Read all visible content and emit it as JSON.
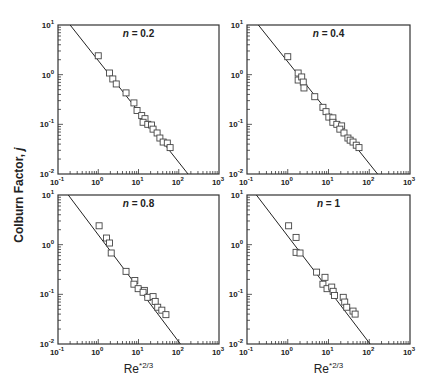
{
  "figure": {
    "ylabel_text": "Colburn Factor, ",
    "ylabel_var": "j",
    "xlabel_base": "Re",
    "xlabel_sup": "*2/3"
  },
  "chart_data": [
    {
      "type": "scatter",
      "panel": "top-left",
      "annotation_var": "n",
      "annotation_value": "= 0.2",
      "xlabel": "",
      "ylabel": "Colburn Factor, j",
      "xscale": "log",
      "yscale": "log",
      "xlim": [
        0.1,
        1000
      ],
      "ylim": [
        0.01,
        10
      ],
      "xticks": [
        "10^-1",
        "10^0",
        "10^1",
        "10^2",
        "10^3"
      ],
      "yticks": [
        "10^-2",
        "10^-1",
        "10^0",
        "10^1"
      ],
      "marker": "open-square",
      "points": [
        [
          1.0,
          2.4
        ],
        [
          1.9,
          1.08
        ],
        [
          2.3,
          0.82
        ],
        [
          2.8,
          0.65
        ],
        [
          4.9,
          0.43
        ],
        [
          7.7,
          0.27
        ],
        [
          9.2,
          0.19
        ],
        [
          12,
          0.15
        ],
        [
          14.5,
          0.13
        ],
        [
          13,
          0.11
        ],
        [
          17,
          0.1
        ],
        [
          21,
          0.097
        ],
        [
          23,
          0.08
        ],
        [
          29,
          0.067
        ],
        [
          34,
          0.053
        ],
        [
          41,
          0.044
        ],
        [
          52,
          0.042
        ],
        [
          61,
          0.034
        ]
      ],
      "fit_line": {
        "x": [
          0.2,
          170
        ],
        "y": [
          10,
          0.01
        ]
      }
    },
    {
      "type": "scatter",
      "panel": "top-right",
      "annotation_var": "n",
      "annotation_value": "= 0.4",
      "xlabel": "",
      "xscale": "log",
      "yscale": "log",
      "xlim": [
        0.1,
        1000
      ],
      "ylim": [
        0.01,
        10
      ],
      "xticks": [
        "10^-1",
        "10^0",
        "10^1",
        "10^2",
        "10^3"
      ],
      "yticks": [
        "10^-2",
        "10^-1",
        "10^0",
        "10^1"
      ],
      "marker": "open-square",
      "points": [
        [
          1.0,
          2.3
        ],
        [
          1.8,
          1.08
        ],
        [
          1.8,
          0.78
        ],
        [
          2.2,
          0.9
        ],
        [
          2.4,
          0.71
        ],
        [
          2.5,
          0.54
        ],
        [
          4.6,
          0.36
        ],
        [
          7.3,
          0.22
        ],
        [
          8.7,
          0.18
        ],
        [
          10.2,
          0.14
        ],
        [
          12.8,
          0.135
        ],
        [
          12.8,
          0.11
        ],
        [
          16,
          0.1
        ],
        [
          21,
          0.093
        ],
        [
          19,
          0.08
        ],
        [
          24,
          0.067
        ],
        [
          30,
          0.053
        ],
        [
          34,
          0.048
        ],
        [
          40,
          0.044
        ],
        [
          48,
          0.038
        ],
        [
          56,
          0.034
        ]
      ],
      "fit_line": {
        "x": [
          0.19,
          160
        ],
        "y": [
          10,
          0.01
        ]
      }
    },
    {
      "type": "scatter",
      "panel": "bottom-left",
      "annotation_var": "n",
      "annotation_value": "= 0.8",
      "xlabel": "Re*2/3",
      "xscale": "log",
      "yscale": "log",
      "xlim": [
        0.1,
        1000
      ],
      "ylim": [
        0.01,
        10
      ],
      "xticks": [
        "10^-1",
        "10^0",
        "10^1",
        "10^2",
        "10^3"
      ],
      "yticks": [
        "10^-2",
        "10^-1",
        "10^0",
        "10^1"
      ],
      "marker": "open-square",
      "points": [
        [
          1.05,
          2.4
        ],
        [
          1.6,
          1.36
        ],
        [
          1.9,
          1.08
        ],
        [
          2.1,
          0.68
        ],
        [
          4.9,
          0.29
        ],
        [
          8.1,
          0.19
        ],
        [
          7.7,
          0.16
        ],
        [
          9.8,
          0.13
        ],
        [
          14,
          0.12
        ],
        [
          13,
          0.11
        ],
        [
          17,
          0.087
        ],
        [
          23,
          0.09
        ],
        [
          26,
          0.072
        ],
        [
          30,
          0.055
        ],
        [
          38,
          0.048
        ],
        [
          48,
          0.039
        ]
      ],
      "fit_line": {
        "x": [
          0.18,
          110
        ],
        "y": [
          10,
          0.01
        ]
      }
    },
    {
      "type": "scatter",
      "panel": "bottom-right",
      "annotation_var": "n",
      "annotation_value": "= 1",
      "xlabel": "Re*2/3",
      "xscale": "log",
      "yscale": "log",
      "xlim": [
        0.1,
        1000
      ],
      "ylim": [
        0.01,
        10
      ],
      "xticks": [
        "10^-1",
        "10^0",
        "10^1",
        "10^2",
        "10^3"
      ],
      "yticks": [
        "10^-2",
        "10^-1",
        "10^0",
        "10^1"
      ],
      "marker": "open-square",
      "points": [
        [
          1.05,
          2.4
        ],
        [
          1.6,
          1.4
        ],
        [
          1.6,
          0.7
        ],
        [
          2.0,
          0.68
        ],
        [
          5.1,
          0.28
        ],
        [
          8.2,
          0.22
        ],
        [
          7.3,
          0.16
        ],
        [
          9.2,
          0.13
        ],
        [
          12,
          0.14
        ],
        [
          13,
          0.115
        ],
        [
          14,
          0.095
        ],
        [
          23,
          0.087
        ],
        [
          25,
          0.07
        ],
        [
          28,
          0.055
        ],
        [
          40,
          0.046
        ],
        [
          45,
          0.04
        ]
      ],
      "fit_line": {
        "x": [
          0.17,
          105
        ],
        "y": [
          10,
          0.01
        ]
      }
    }
  ],
  "layout": {
    "panels": [
      {
        "x0": 58,
        "y0": 25,
        "x1": 219,
        "y1": 174
      },
      {
        "x0": 247,
        "y0": 25,
        "x1": 410,
        "y1": 174
      },
      {
        "x0": 58,
        "y0": 195,
        "x1": 219,
        "y1": 344
      },
      {
        "x0": 247,
        "y0": 195,
        "x1": 410,
        "y1": 344
      }
    ],
    "colors": {
      "axis": "#333333",
      "marker": "#444444",
      "line": "#222222",
      "text": "#222222"
    }
  }
}
